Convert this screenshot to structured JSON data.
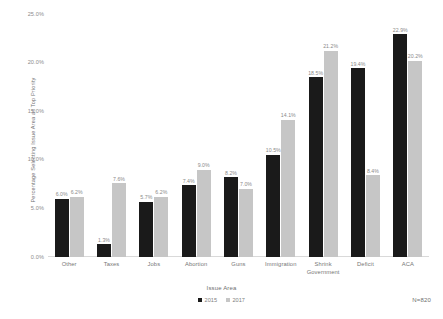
{
  "chart_data": {
    "type": "bar",
    "title": "",
    "subtitle": "",
    "xlabel": "Issue Area",
    "ylabel": "Percentage Selecting Issue Area as Top Priority",
    "categories": [
      "Other",
      "Taxes",
      "Jobs",
      "Abortion",
      "Guns",
      "Immigration",
      "Shrink Government",
      "Deficit",
      "ACA"
    ],
    "category_lines": [
      [
        "Other"
      ],
      [
        "Taxes"
      ],
      [
        "Jobs"
      ],
      [
        "Abortion"
      ],
      [
        "Guns"
      ],
      [
        "Immigration"
      ],
      [
        "Shrink",
        "Government"
      ],
      [
        "Deficit"
      ],
      [
        "ACA"
      ]
    ],
    "series": [
      {
        "name": "2015",
        "color": "#1a1a1a",
        "values": [
          6.0,
          1.3,
          5.7,
          7.4,
          8.2,
          10.5,
          18.5,
          19.4,
          22.9
        ],
        "labels": [
          "6.0%",
          "1.3%",
          "5.7%",
          "7.4%",
          "8.2%",
          "10.5%",
          "18.5%",
          "19.4%",
          "22.9%"
        ]
      },
      {
        "name": "2017",
        "color": "#c6c6c6",
        "values": [
          6.2,
          7.6,
          6.2,
          9.0,
          7.0,
          14.1,
          21.2,
          8.4,
          20.2
        ],
        "labels": [
          "6.2%",
          "7.6%",
          "6.2%",
          "9.0%",
          "7.0%",
          "14.1%",
          "21.2%",
          "8.4%",
          "20.2%"
        ]
      }
    ],
    "ylim": [
      0,
      25
    ],
    "yticks": [
      0,
      5,
      10,
      15,
      20,
      25
    ],
    "ytick_labels": [
      "0.0%",
      "5.0%",
      "10.0%",
      "15.0%",
      "20.0%",
      "25.0%"
    ],
    "grid": false,
    "legend_position": "bottom",
    "annotation": "N=820"
  },
  "legend": {
    "items": [
      {
        "label": "2015"
      },
      {
        "label": "2017"
      }
    ]
  }
}
